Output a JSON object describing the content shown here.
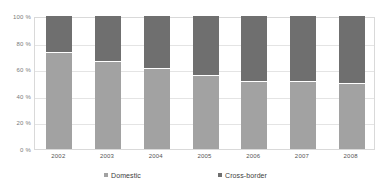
{
  "chart_data": {
    "type": "bar",
    "stacked": true,
    "percent": true,
    "title": "",
    "subtitle": "",
    "xlabel": "",
    "ylabel": "",
    "categories": [
      "2002",
      "2003",
      "2004",
      "2005",
      "2006",
      "2007",
      "2008"
    ],
    "series": [
      {
        "name": "Domestic",
        "color": "#a2a2a2",
        "values": [
          73,
          66,
          61,
          56,
          51,
          51,
          50
        ]
      },
      {
        "name": "Cross-border",
        "color": "#6f6f6f",
        "values": [
          27,
          34,
          39,
          44,
          49,
          49,
          50
        ]
      }
    ],
    "ylim": [
      0,
      100
    ],
    "yticks": [
      0,
      20,
      40,
      60,
      80,
      100
    ],
    "ytick_labels": [
      "0 %",
      "20 %",
      "40 %",
      "60 %",
      "80 %",
      "100 %"
    ],
    "grid": true,
    "legend_position": "bottom"
  },
  "legend": {
    "items": [
      {
        "label": "Domestic",
        "color": "#a2a2a2",
        "marker": "square-swatch"
      },
      {
        "label": "Cross-border",
        "color": "#6f6f6f",
        "marker": "square-swatch"
      }
    ]
  },
  "axes": {
    "y_tick_labels": [
      "100 %",
      "80 %",
      "60 %",
      "40 %",
      "20 %",
      "0 %"
    ],
    "x_tick_labels": [
      "2002",
      "2003",
      "2004",
      "2005",
      "2006",
      "2007",
      "2008"
    ]
  },
  "colors": {
    "domestic": "#a2a2a2",
    "cross_border": "#6f6f6f",
    "gridline": "#e4e4e4",
    "frame": "#d9d9d9",
    "background": "#ffffff"
  }
}
